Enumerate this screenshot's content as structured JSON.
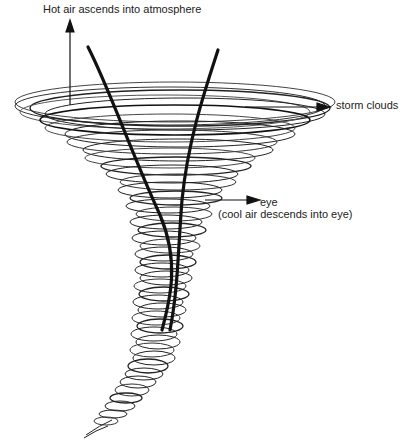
{
  "diagram": {
    "type": "tornado-hurricane-schematic",
    "labels": {
      "hot_air": "Hot air ascends into atmosphere",
      "storm_clouds": "storm clouds",
      "eye": "eye",
      "eye_note": "(cool air descends into eye)"
    },
    "colors": {
      "ink": "#111111",
      "light_ink": "#555555",
      "background": "#ffffff"
    },
    "arrows": [
      {
        "name": "hot-air-arrow",
        "direction": "up"
      },
      {
        "name": "storm-clouds-arrow",
        "direction": "right"
      },
      {
        "name": "eye-arrow",
        "direction": "right"
      }
    ]
  }
}
